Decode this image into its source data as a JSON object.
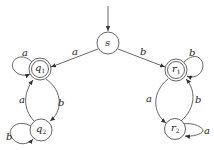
{
  "diagram": {
    "type": "finite-automaton",
    "start_state": "s",
    "states": [
      {
        "id": "s",
        "label": "s",
        "sub": "",
        "accepting": false
      },
      {
        "id": "q1",
        "label": "q",
        "sub": "1",
        "accepting": true
      },
      {
        "id": "q2",
        "label": "q",
        "sub": "2",
        "accepting": false
      },
      {
        "id": "r1",
        "label": "r",
        "sub": "1",
        "accepting": true
      },
      {
        "id": "r2",
        "label": "r",
        "sub": "2",
        "accepting": false
      }
    ],
    "transitions": [
      {
        "from": "s",
        "to": "q1",
        "label": "a"
      },
      {
        "from": "s",
        "to": "r1",
        "label": "b"
      },
      {
        "from": "q1",
        "to": "q1",
        "label": "a"
      },
      {
        "from": "q1",
        "to": "q2",
        "label": "b"
      },
      {
        "from": "q2",
        "to": "q1",
        "label": "a"
      },
      {
        "from": "q2",
        "to": "q2",
        "label": "b"
      },
      {
        "from": "r1",
        "to": "r1",
        "label": "b"
      },
      {
        "from": "r1",
        "to": "r2",
        "label": "a"
      },
      {
        "from": "r2",
        "to": "r1",
        "label": "b"
      },
      {
        "from": "r2",
        "to": "r2",
        "label": "a"
      }
    ]
  }
}
